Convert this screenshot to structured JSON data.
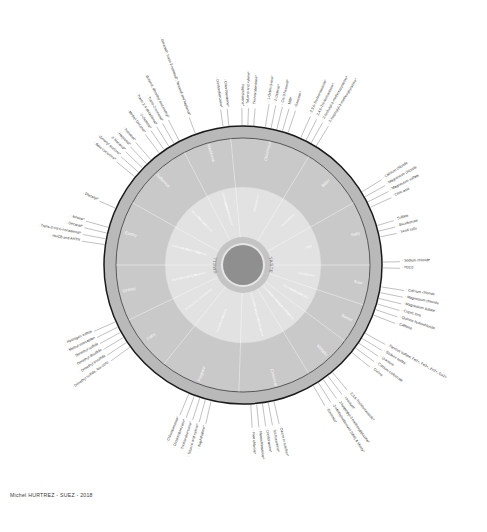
{
  "figure": {
    "credit": "Michel HURTREZ - SUEZ - 2018",
    "center": {
      "smell_label": "SMELL",
      "taste_label": "TASTE"
    },
    "colors": {
      "outer_ring": "#b9b9b9",
      "mid_ring": "#c9c9c9",
      "inner_ring": "#e2e2e2",
      "hub_ring": "#c4c4c4",
      "hub_core": "#8f8f8f",
      "outline": "#1a1a1a",
      "label_text": "#2f2f2f",
      "ring_text": "#ffffff"
    }
  },
  "chart_data": {
    "type": "pie",
    "xlabel": "",
    "ylabel": "",
    "grid": false,
    "legend_position": "none",
    "rings": [
      {
        "name": "hub",
        "label": "SMELL / TASTE"
      },
      {
        "name": "inner",
        "label": "sub-descriptor ring"
      },
      {
        "name": "outer",
        "label": "descriptor ring"
      },
      {
        "name": "spokes",
        "label": "reference compound ring"
      }
    ],
    "categories": [
      "Salty",
      "Bitter",
      "Chlorinous / Ozonous",
      "Medicinal",
      "Sulfurous",
      "Earthy / Musty",
      "Grassy / Hay / Straw",
      "Fishy / Rancid",
      "Fragrant / Fruity / Vegetable",
      "Chemical / Hydrocarbon",
      "Metallic",
      "Sweet",
      "Sour"
    ],
    "values": [
      8,
      8,
      10,
      6,
      9,
      8,
      7,
      7,
      10,
      9,
      6,
      5,
      5
    ],
    "sectors": [
      {
        "category": "Salty",
        "angle_deg": 0,
        "sub": [
          "Salty"
        ],
        "references": [
          "H2O2",
          "Sodium chloride"
        ]
      },
      {
        "category": "Bitter",
        "angle_deg": 22,
        "sub": [
          "Bitter",
          "Metallic"
        ],
        "references": [
          "Caffeine",
          "Quinine hydrochloride",
          "Cupric ions",
          "Magnesium sulfate",
          "Magnesium chloride",
          "Calcium chloride"
        ]
      },
      {
        "category": "Sour",
        "angle_deg": 48,
        "sub": [
          "Sour",
          "Alkaline"
        ],
        "references": [
          "Ozone",
          "Calcium carbonate",
          "Uranium",
          "Sodium sulfite",
          "Ferrous sulfate: Fe2+, Fe3+, Zn2+, Cu2+"
        ]
      },
      {
        "category": "Chlorinous",
        "angle_deg": 72,
        "sub": [
          "Chlorinous",
          "Ozonous",
          "Swimming pool"
        ],
        "references": [
          "Geosmin*",
          "2-Methylisoborneol (MIB) & Musty*",
          "2-Isopropyl-3-methoxypyrazine*",
          "2-Isobutyl-3-methoxypyrazine*",
          "2,4,6-Trichloroanisole*",
          "2,3,6-Trichloroanisole*"
        ]
      },
      {
        "category": "Medicinal",
        "angle_deg": 96,
        "sub": [
          "Medicinal",
          "Phenolic",
          "Iodoform"
        ],
        "references": [
          "Free chlorine*",
          "Monochloramine*",
          "Dichloramine*",
          "Trichloramine*",
          "Ozone in solution*"
        ]
      },
      {
        "category": "Sulfurous",
        "angle_deg": 120,
        "sub": [
          "Sulfurous",
          "Septic",
          "Rotten egg",
          "Cabbage"
        ],
        "references": [
          "Cis-3-hexenol*",
          "Hexanal*",
          "Trans-2-hexenal*",
          "2,4-Heptadienal*",
          "2-Octenal*",
          "1-Octen-3-one*"
        ]
      },
      {
        "category": "Earthy / Musty",
        "angle_deg": 150,
        "sub": [
          "Earthy",
          "Musty",
          "Mouldy",
          "Swampy"
        ],
        "references": [
          "Hydrogen sulfide",
          "Methyl mercaptan",
          "Dimethyl sulfide",
          "Dimethyl disulfide",
          "Dimethyl trisulfide",
          "Dimethyl sulfide, low conc."
        ]
      },
      {
        "category": "Grassy / Hay / Straw",
        "angle_deg": 178,
        "sub": [
          "Grassy",
          "Hay",
          "Straw",
          "Woody"
        ],
        "references": [
          "Ionone*",
          "Decanal*",
          "Trans-2-cis-6-nonadienal*",
          "HHCB and AHTN",
          "Diacetyl*"
        ]
      },
      {
        "category": "Fishy / Rancid",
        "angle_deg": 205,
        "sub": [
          "Fishy",
          "Rancid",
          "Marshy"
        ],
        "references": [
          "Nonanal*",
          "Heptanal*",
          "2-Nonenal*",
          "Geranyl acetone*",
          "Beta-cyclocitral*"
        ]
      },
      {
        "category": "Fragrant / Fruity / Vegetable",
        "angle_deg": 232,
        "sub": [
          "Fragrant",
          "Fruity",
          "Vegetable",
          "Floral",
          "Cucumber",
          "Melon"
        ],
        "references": [
          "Geraniol*, trans-2-nonenal*, hexanal and heptanal*",
          "Butanol, dimethyl and methyl*",
          "Trans-2-nonenal*",
          "Trans-2,4-decadienal*",
          "2-Octenal*"
        ]
      },
      {
        "category": "Chemical / Hydrocarbon",
        "angle_deg": 258,
        "sub": [
          "Chemical",
          "Hydrocarbon",
          "Solvent",
          "Petroleum",
          "Turpentine"
        ],
        "references": [
          "Chlorobenzene*",
          "Dichlorobenzene*",
          "Trichlorobenzene*",
          "Toluene and xylene*",
          "Naphthalene*"
        ]
      },
      {
        "category": "Metallic",
        "angle_deg": 284,
        "sub": [
          "Metallic",
          "Astringent",
          "Dry mouth"
        ],
        "references": [
          "Citric acid",
          "Magnesium sulfate",
          "Magnesium chloride",
          "Calcium chloride"
        ]
      },
      {
        "category": "Sweet",
        "angle_deg": 308,
        "sub": [
          "Sweet",
          "Saline"
        ],
        "references": [
          "Lead salts",
          "Bicarbonate",
          "Sulfate"
        ]
      }
    ]
  },
  "spoke_groups": [
    {
      "id": "north-northwest",
      "angle_deg": 110,
      "labels": [
        "Geraniol*, trans-2-nonenal*, hexanal and heptanal*"
      ]
    },
    {
      "id": "northwest-a",
      "angle_deg": 122,
      "labels": [
        "Butanol, dimethyl and methyl*",
        "Trans-2-nonenal*",
        "Trans-2,4-decadienal*",
        "2-Octenal*",
        "Methyl Decanal*"
      ]
    },
    {
      "id": "north-chlorobenzene",
      "angle_deg": 97,
      "labels": [
        "Chlorobenzene*",
        "Dichlorobenzene*"
      ]
    },
    {
      "id": "north-geosmin",
      "angle_deg": 76,
      "labels": [
        "Geosmin*",
        "MIB*",
        "Cis-3-hexenol*",
        "2-Octenal*",
        "1-Octen-3-one*"
      ]
    },
    {
      "id": "northeast",
      "angle_deg": 62,
      "labels": [
        "2-Isopropyl-3-methoxypyrazine*",
        "2-Isobutyl-3-methoxypyrazine*",
        "2,4,6-Trichloroanisole*",
        "2,3,6-Trichloroanisole*"
      ]
    },
    {
      "id": "east-cupric",
      "angle_deg": 28,
      "labels": [
        "Citric acid",
        "Magnesium sulfate",
        "Magnesium chloride",
        "Calcium chloride"
      ]
    },
    {
      "id": "east-lead",
      "angle_deg": 14,
      "labels": [
        "Lead salts",
        "Bicarbonate",
        "Sulfate"
      ]
    },
    {
      "id": "east-salty",
      "angle_deg": 0,
      "labels": [
        "H2O2",
        "Sodium chloride"
      ]
    },
    {
      "id": "east-bitter",
      "angle_deg": -15,
      "labels": [
        "Caffeine",
        "Quinine hydrochloride",
        "Cupric ions",
        "Magnesium sulfate",
        "Magnesium chloride",
        "Calcium chloride"
      ]
    },
    {
      "id": "southeast-ozone",
      "angle_deg": -34,
      "labels": [
        "Ozone",
        "Calcium carbonate",
        "Uranium",
        "Sodium sulfite",
        "Ferrous sulfate: Fe2+, Fe3+, Zn2+, Cu2+"
      ]
    },
    {
      "id": "southeast-geosmin",
      "angle_deg": -55,
      "labels": [
        "Geosmin*",
        "2-Methylisoborneol (MIB) & Musty*",
        "2-Isopropyl-3-methoxypyrazine*",
        "Uranium*",
        "2,3,6-Trichloroanisole*"
      ]
    },
    {
      "id": "south-chlorine",
      "angle_deg": -82,
      "labels": [
        "Free chlorine*",
        "Monochloramine*",
        "Dichloramine*",
        "Trichloramine*",
        "Ozone in solution*"
      ]
    },
    {
      "id": "southwest-toluene",
      "angle_deg": -108,
      "labels": [
        "Chlorobenzene*",
        "Dichlorobenzene*",
        "Trichlorobenzene*",
        "Toluene and xylene*",
        "Naphthalene*"
      ]
    },
    {
      "id": "west-sulfides",
      "angle_deg": -150,
      "labels": [
        "Hydrogen sulfide",
        "Methyl mercaptan",
        "Dimethyl sulfide",
        "Dimethyl disulfide",
        "Dimethyl trisulfide",
        "Dimethyl sulfide, low conc."
      ]
    },
    {
      "id": "west-ionone",
      "angle_deg": 168,
      "labels": [
        "Ionone*",
        "Decanal*",
        "Trans-2-cis-6-nonadienal*",
        "HHCB and AHTN"
      ]
    },
    {
      "id": "west-diacetyl",
      "angle_deg": 156,
      "labels": [
        "Diacetyl*"
      ]
    },
    {
      "id": "northwest-nonanal",
      "angle_deg": 136,
      "labels": [
        "Nonanal*",
        "Heptanal*",
        "2-Nonenal*",
        "Geranyl acetone*",
        "Beta-cyclocitral*"
      ]
    },
    {
      "id": "north-toluene",
      "angle_deg": 88,
      "labels": [
        "Trichlorobenzene*",
        "Toluene and xylene*",
        "Naphthalene*"
      ]
    }
  ]
}
